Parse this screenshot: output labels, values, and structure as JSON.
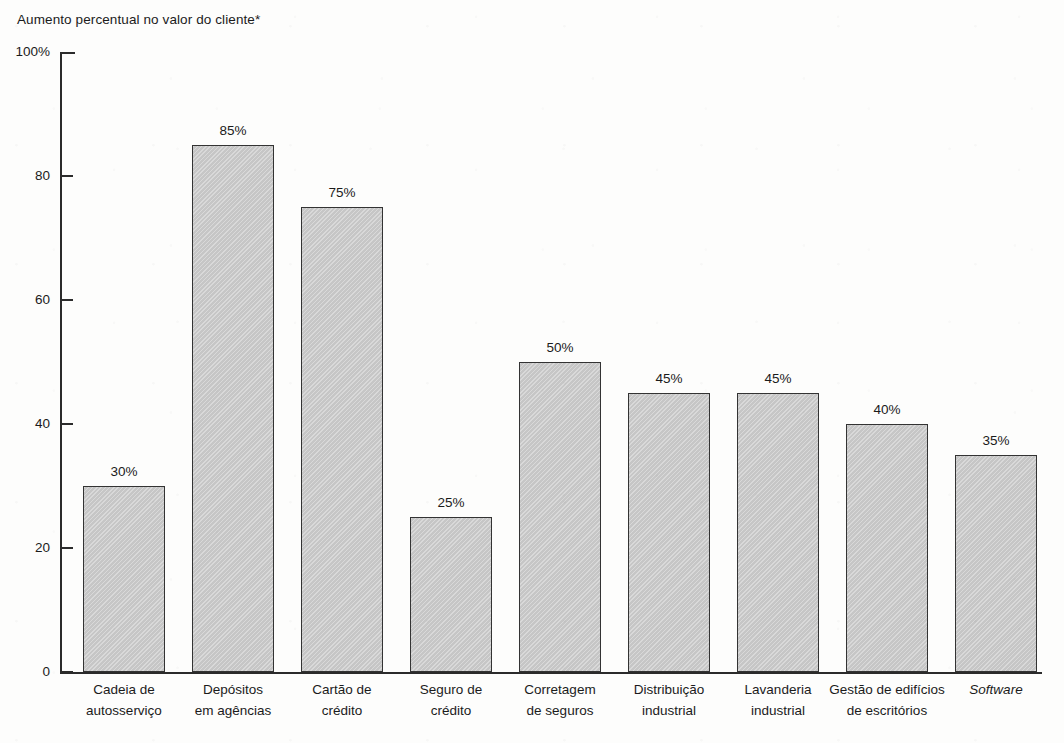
{
  "chart_data": {
    "type": "bar",
    "title": "Aumento percentual no valor do cliente*",
    "xlabel": "",
    "ylabel": "",
    "ylim": [
      0,
      100
    ],
    "yticks": [
      "0",
      "20",
      "40",
      "60",
      "80",
      "100%"
    ],
    "ytick_values": [
      0,
      20,
      40,
      60,
      80,
      100
    ],
    "grid": false,
    "legend": null,
    "categories": [
      "Cadeia de\nautosserviço",
      "Depósitos\nem agências",
      "Cartão de\ncrédito",
      "Seguro de\ncrédito",
      "Corretagem\nde seguros",
      "Distribuição\nindustrial",
      "Lavanderia\nindustrial",
      "Gestão de edifícios\nde escritórios",
      "Software"
    ],
    "values": [
      30,
      85,
      75,
      25,
      50,
      45,
      45,
      40,
      35
    ],
    "data_labels": [
      "30%",
      "85%",
      "75%",
      "25%",
      "50%",
      "45%",
      "45%",
      "40%",
      "35%"
    ],
    "bar_color": "#c9c9c9",
    "bar_edge_color": "#333333",
    "axis_color": "#2b2b2b",
    "background_color": "#fdfdfc"
  },
  "bars": [
    {
      "label_line1": "Cadeia de",
      "label_line2": "autosserviço",
      "value": 30,
      "value_label": "30%",
      "italic": false
    },
    {
      "label_line1": "Depósitos",
      "label_line2": "em agências",
      "value": 85,
      "value_label": "85%",
      "italic": false
    },
    {
      "label_line1": "Cartão de",
      "label_line2": "crédito",
      "value": 75,
      "value_label": "75%",
      "italic": false
    },
    {
      "label_line1": "Seguro de",
      "label_line2": "crédito",
      "value": 25,
      "value_label": "25%",
      "italic": false
    },
    {
      "label_line1": "Corretagem",
      "label_line2": "de seguros",
      "value": 50,
      "value_label": "50%",
      "italic": false
    },
    {
      "label_line1": "Distribuição",
      "label_line2": "industrial",
      "value": 45,
      "value_label": "45%",
      "italic": false
    },
    {
      "label_line1": "Lavanderia",
      "label_line2": "industrial",
      "value": 45,
      "value_label": "45%",
      "italic": false
    },
    {
      "label_line1": "Gestão de edifícios",
      "label_line2": "de escritórios",
      "value": 40,
      "value_label": "40%",
      "italic": false
    },
    {
      "label_line1": "Software",
      "label_line2": "",
      "value": 35,
      "value_label": "35%",
      "italic": true
    }
  ],
  "yaxis": {
    "ticks": [
      {
        "label": "100%",
        "value": 100
      },
      {
        "label": "80",
        "value": 80
      },
      {
        "label": "60",
        "value": 60
      },
      {
        "label": "40",
        "value": 40
      },
      {
        "label": "20",
        "value": 20
      },
      {
        "label": "0",
        "value": 0
      }
    ]
  }
}
